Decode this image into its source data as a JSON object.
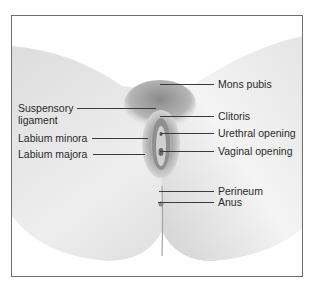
{
  "figure": {
    "type": "anatomical-illustration",
    "labels": {
      "mons_pubis": "Mons pubis",
      "suspensory_ligament_line1": "Suspensory",
      "suspensory_ligament_line2": "ligament",
      "clitoris": "Clitoris",
      "urethral_opening": "Urethral opening",
      "labium_minora": "Labium minora",
      "labium_majora": "Labium majora",
      "vaginal_opening": "Vaginal opening",
      "perineum": "Perineum",
      "anus": "Anus"
    },
    "colors": {
      "frame_border": "#6f6f6f",
      "skin_light": "#f2f2f2",
      "skin_shadow": "#bdbdbd",
      "label_text": "#2a2a2a",
      "leader_line": "#3a3a3a"
    }
  }
}
